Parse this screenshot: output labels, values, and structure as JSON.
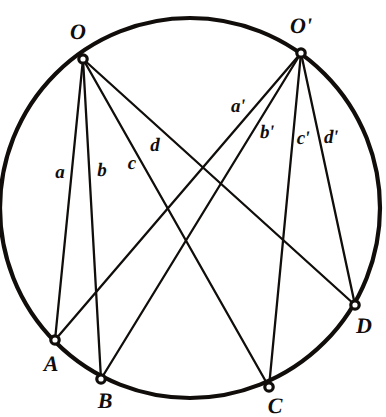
{
  "figure": {
    "type": "geometry-diagram",
    "canvas": {
      "width": 386,
      "height": 417
    },
    "stroke_color": "#100d0b",
    "background_color": "#ffffff",
    "circle": {
      "cx": 190,
      "cy": 208,
      "r": 190,
      "stroke_width": 4.2
    },
    "chord_stroke_width": 2.3,
    "vertex_marker": {
      "radius": 4.2,
      "fill": "#ffffff",
      "stroke_width": 3.2
    },
    "points": [
      {
        "id": "O",
        "label": "O",
        "x": 83,
        "y": 59,
        "label_x": 78,
        "label_y": 32
      },
      {
        "id": "Op",
        "label": "O'",
        "x": 301,
        "y": 53,
        "label_x": 301,
        "label_y": 26
      },
      {
        "id": "A",
        "label": "A",
        "x": 55,
        "y": 340,
        "label_x": 51,
        "label_y": 364
      },
      {
        "id": "B",
        "label": "B",
        "x": 101,
        "y": 379,
        "label_x": 105,
        "label_y": 401
      },
      {
        "id": "C",
        "label": "C",
        "x": 269,
        "y": 387,
        "label_x": 275,
        "label_y": 406
      },
      {
        "id": "D",
        "label": "D",
        "x": 355,
        "y": 305,
        "label_x": 364,
        "label_y": 326
      }
    ],
    "chords": [
      {
        "id": "chord-a",
        "from": "O",
        "to": "A",
        "label": "a",
        "label_x": 60,
        "label_y": 172
      },
      {
        "id": "chord-b",
        "from": "O",
        "to": "B",
        "label": "b",
        "label_x": 102,
        "label_y": 170
      },
      {
        "id": "chord-c",
        "from": "O",
        "to": "C",
        "label": "c",
        "label_x": 132,
        "label_y": 163
      },
      {
        "id": "chord-d",
        "from": "O",
        "to": "D",
        "label": "d",
        "label_x": 155,
        "label_y": 145
      },
      {
        "id": "chord-ap",
        "from": "Op",
        "to": "A",
        "label": "a'",
        "label_x": 238,
        "label_y": 106
      },
      {
        "id": "chord-bp",
        "from": "Op",
        "to": "B",
        "label": "b'",
        "label_x": 267,
        "label_y": 132
      },
      {
        "id": "chord-cp",
        "from": "Op",
        "to": "C",
        "label": "c'",
        "label_x": 303,
        "label_y": 138
      },
      {
        "id": "chord-dp",
        "from": "Op",
        "to": "D",
        "label": "d'",
        "label_x": 331,
        "label_y": 137
      }
    ]
  }
}
